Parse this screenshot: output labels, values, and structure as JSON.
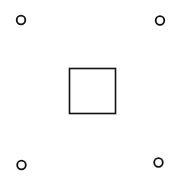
{
  "canvas": {
    "width": 178,
    "height": 186,
    "background": "#ffffff"
  },
  "stroke_color": "#111111",
  "square": {
    "x": 69.5,
    "y": 68.5,
    "width": 46,
    "height": 45,
    "stroke_width": 1.6
  },
  "circles": [
    {
      "cx": 21,
      "cy": 20,
      "r": 4.3
    },
    {
      "cx": 160,
      "cy": 20.5,
      "r": 4.3
    },
    {
      "cx": 21.5,
      "cy": 165,
      "r": 4.3
    },
    {
      "cx": 158.5,
      "cy": 162.5,
      "r": 4.3
    }
  ],
  "circle_stroke_width": 1.8
}
